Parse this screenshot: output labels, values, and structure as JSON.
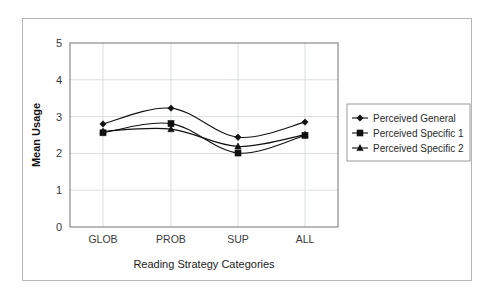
{
  "chart_data": {
    "type": "line",
    "title": "",
    "xlabel": "Reading Strategy Categories",
    "ylabel": "Mean Usage",
    "categories": [
      "GLOB",
      "PROB",
      "SUP",
      "ALL"
    ],
    "ylim": [
      0,
      5
    ],
    "yticks": [
      "0",
      "1",
      "2",
      "3",
      "4",
      "5"
    ],
    "grid": true,
    "legend_position": "right",
    "series": [
      {
        "name": "Perceived General",
        "marker": "diamond",
        "color": "#111111",
        "values": [
          2.8,
          3.23,
          2.44,
          2.85
        ]
      },
      {
        "name": "Perceived Specific 1",
        "marker": "square",
        "color": "#111111",
        "values": [
          2.56,
          2.81,
          2.01,
          2.49
        ]
      },
      {
        "name": "Perceived Specific 2",
        "marker": "triangle",
        "color": "#111111",
        "values": [
          2.6,
          2.66,
          2.19,
          2.51
        ]
      }
    ]
  },
  "legend": {
    "entries": [
      {
        "label": "Perceived General",
        "marker": "diamond-marker-icon"
      },
      {
        "label": "Perceived Specific 1",
        "marker": "square-marker-icon"
      },
      {
        "label": "Perceived Specific 2",
        "marker": "triangle-marker-icon"
      }
    ]
  },
  "axes": {
    "y_title": "Mean Usage",
    "x_title": "Reading Strategy Categories",
    "y_tick_labels": [
      "5",
      "4",
      "3",
      "2",
      "1",
      "0"
    ],
    "x_tick_labels": [
      "GLOB",
      "PROB",
      "SUP",
      "ALL"
    ]
  },
  "colors": {
    "ink": "#111111",
    "grid": "#d9dde2",
    "axis": "#8a8a8a",
    "frame": "#b6b6b6",
    "background": "#ffffff"
  }
}
